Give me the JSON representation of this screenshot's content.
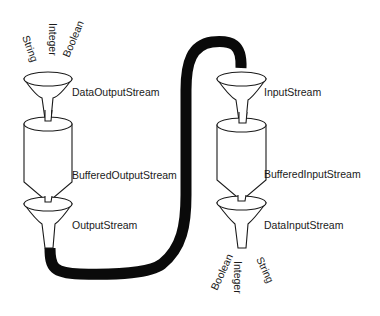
{
  "diagram": {
    "kind": "java-stream-chaining",
    "output_side": {
      "input_types": [
        "String",
        "Integer",
        "Boolean"
      ],
      "layers": [
        {
          "label": "DataOutputStream",
          "shape": "funnel"
        },
        {
          "label": "BufferedOutputStream",
          "shape": "cylinder-funnel"
        },
        {
          "label": "OutputStream",
          "shape": "funnel"
        }
      ]
    },
    "input_side": {
      "layers": [
        {
          "label": "InputStream",
          "shape": "funnel"
        },
        {
          "label": "BufferedInputStream",
          "shape": "cylinder-funnel"
        },
        {
          "label": "DataInputStream",
          "shape": "funnel"
        }
      ],
      "output_types": [
        "Boolean",
        "Integer",
        "String"
      ]
    },
    "connector": "thick-cable",
    "colors": {
      "line": "#1a1a1a",
      "cable": "#0a0a0a",
      "background": "#ffffff"
    }
  }
}
